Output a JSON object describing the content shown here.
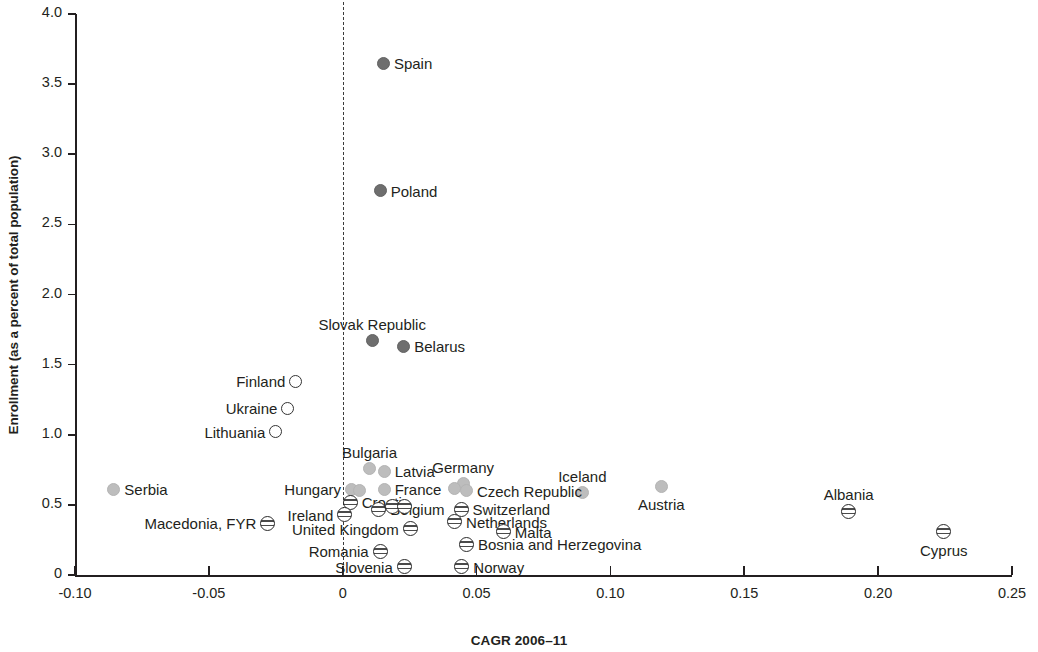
{
  "chart_data": {
    "type": "scatter",
    "title": "",
    "xlabel": "CAGR 2006–11",
    "ylabel": "Enrollment (as a percent of total population)",
    "xlim": [
      -0.1,
      0.25
    ],
    "ylim": [
      0,
      4.0
    ],
    "xticks": [
      "-0.10",
      "-0.05",
      "0",
      "0.05",
      "0.10",
      "0.15",
      "0.20",
      "0.25"
    ],
    "xtick_values": [
      -0.1,
      -0.05,
      0,
      0.05,
      0.1,
      0.15,
      0.2,
      0.25
    ],
    "yticks": [
      "0",
      "0.5",
      "1.0",
      "1.5",
      "2.0",
      "2.5",
      "3.0",
      "3.5",
      "4.0"
    ],
    "ytick_values": [
      0,
      0.5,
      1.0,
      1.5,
      2.0,
      2.5,
      3.0,
      3.5,
      4.0
    ],
    "grid": false,
    "legend": "none",
    "annotations": [
      {
        "kind": "vertical-dashed-line",
        "x": 0.0,
        "label": "zero-growth reference line"
      }
    ],
    "marker_styles": {
      "dark": "dark gray filled circle",
      "light": "light gray filled circle",
      "hollow": "white open circle with dark outline",
      "striped": "horizontally banded circle"
    },
    "points": [
      {
        "name": "Spain",
        "x": 0.0152,
        "y": 3.65,
        "style": "dark",
        "label_pos": "r"
      },
      {
        "name": "Poland",
        "x": 0.014,
        "y": 2.74,
        "style": "dark",
        "label_pos": "r"
      },
      {
        "name": "Slovak Republic",
        "x": 0.011,
        "y": 1.67,
        "style": "dark",
        "label_pos": "above"
      },
      {
        "name": "Belarus",
        "x": 0.0228,
        "y": 1.63,
        "style": "dark",
        "label_pos": "r"
      },
      {
        "name": "Finland",
        "x": -0.0175,
        "y": 1.38,
        "style": "hollow",
        "label_pos": "l"
      },
      {
        "name": "Ukraine",
        "x": -0.0205,
        "y": 1.19,
        "style": "hollow",
        "label_pos": "l"
      },
      {
        "name": "Lithuania",
        "x": -0.025,
        "y": 1.02,
        "style": "hollow",
        "label_pos": "l"
      },
      {
        "name": "Bulgaria",
        "x": 0.01,
        "y": 0.76,
        "style": "light",
        "label_pos": "above"
      },
      {
        "name": "Latvia",
        "x": 0.0155,
        "y": 0.74,
        "style": "light",
        "label_pos": "r"
      },
      {
        "name": "Germany",
        "x": 0.045,
        "y": 0.65,
        "style": "light",
        "label_pos": "above"
      },
      {
        "name": "Iceland",
        "x": 0.0895,
        "y": 0.59,
        "style": "light",
        "label_pos": "above"
      },
      {
        "name": "Hungary",
        "x": 0.0033,
        "y": 0.61,
        "style": "light",
        "label_pos": "l"
      },
      {
        "name": "France",
        "x": 0.0155,
        "y": 0.61,
        "style": "light",
        "label_pos": "r"
      },
      {
        "name": "Czech Republic",
        "x": 0.0462,
        "y": 0.6,
        "style": "light",
        "label_pos": "r"
      },
      {
        "name": "Austria",
        "x": 0.119,
        "y": 0.63,
        "style": "light",
        "label_pos": "below"
      },
      {
        "name": "Serbia",
        "x": -0.0855,
        "y": 0.61,
        "style": "light",
        "label_pos": "r"
      },
      {
        "name": "Croatia",
        "x": 0.0028,
        "y": 0.52,
        "style": "striped",
        "label_pos": "r"
      },
      {
        "name": "Switzerland",
        "x": 0.0442,
        "y": 0.47,
        "style": "striped",
        "label_pos": "r"
      },
      {
        "name": "Macedonia, FYR",
        "x": -0.028,
        "y": 0.37,
        "style": "striped",
        "label_pos": "l"
      },
      {
        "name": "Ireland",
        "x": 0.0008,
        "y": 0.43,
        "style": "striped",
        "label_pos": "l"
      },
      {
        "name": "Belgium",
        "x": 0.0135,
        "y": 0.47,
        "style": "striped",
        "label_pos": "r"
      },
      {
        "name": "Netherlands",
        "x": 0.0418,
        "y": 0.38,
        "style": "striped",
        "label_pos": "r"
      },
      {
        "name": "United Kingdom",
        "x": 0.0252,
        "y": 0.33,
        "style": "striped",
        "label_pos": "l"
      },
      {
        "name": "Malta",
        "x": 0.06,
        "y": 0.31,
        "style": "striped",
        "label_pos": "r"
      },
      {
        "name": "Romania",
        "x": 0.014,
        "y": 0.17,
        "style": "striped",
        "label_pos": "l"
      },
      {
        "name": "Bosnia and Herzegovina",
        "x": 0.0462,
        "y": 0.22,
        "style": "striped",
        "label_pos": "r"
      },
      {
        "name": "Slovenia",
        "x": 0.023,
        "y": 0.06,
        "style": "striped",
        "label_pos": "l"
      },
      {
        "name": "Norway",
        "x": 0.0445,
        "y": 0.06,
        "style": "striped",
        "label_pos": "r"
      },
      {
        "name": "Albania",
        "x": 0.189,
        "y": 0.45,
        "style": "striped",
        "label_pos": "above"
      },
      {
        "name": "Cyprus",
        "x": 0.2245,
        "y": 0.31,
        "style": "striped",
        "label_pos": "below"
      },
      {
        "name": "Croatia2",
        "x": 0.0185,
        "y": 0.49,
        "style": "striped",
        "label_pos": "none"
      },
      {
        "name": "Croatia3",
        "x": 0.023,
        "y": 0.49,
        "style": "striped",
        "label_pos": "none"
      },
      {
        "name": "Hungary2",
        "x": 0.0062,
        "y": 0.6,
        "style": "light",
        "label_pos": "none"
      },
      {
        "name": "Germany2",
        "x": 0.0418,
        "y": 0.615,
        "style": "light",
        "label_pos": "none"
      }
    ]
  },
  "colors": {
    "axis": "#231f20",
    "dark_marker": "#6e6e6e",
    "light_marker": "#bdbdbd",
    "reference_line": "#3c3c3c"
  }
}
